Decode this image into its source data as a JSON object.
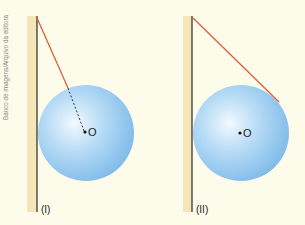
{
  "credit": "Banco de imagens/Arquivo da editora",
  "figures": [
    {
      "label": "(I)",
      "center_label": "O",
      "rope_style": "attached-radially (dashed extension to center)"
    },
    {
      "label": "(II)",
      "center_label": "O",
      "rope_style": "tangent"
    }
  ],
  "colors": {
    "background": "#fdfbea",
    "wall_band": "#f5e6b8",
    "wall_line": "#3a3a3a",
    "rope": "#d9603b",
    "sphere_light": "#eaf5fd",
    "sphere_mid": "#a9d4f3",
    "sphere_dark": "#7fbbe9"
  }
}
